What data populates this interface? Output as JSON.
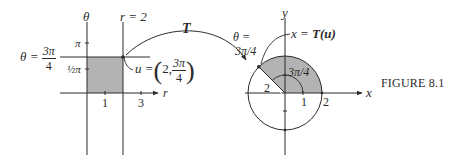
{
  "figure": {
    "caption": "FIGURE 8.1",
    "colors": {
      "line": "#2b2b2b",
      "shade": "#b3b3b3",
      "background": "#ffffff"
    }
  },
  "left_plot": {
    "vertical_axis_label": "θ",
    "horizontal_axis_label": "r",
    "line_r_label": "r = 2",
    "line_theta_label_lhs": "θ =",
    "line_theta_label_num": "3π",
    "line_theta_label_den": "4",
    "tick_pi": "π",
    "tick_half_pi": "½π",
    "tick_r_1": "1",
    "tick_r_3": "3",
    "point_label_lhs": "u =",
    "point_coord_r": "2,",
    "point_coord_num": "3π",
    "point_coord_den": "4"
  },
  "mapping": {
    "arrow_label": "T"
  },
  "right_plot": {
    "y_axis_label": "y",
    "x_axis_label": "x",
    "ray_label_top": "θ =",
    "ray_label_bottom": "3π/4",
    "image_label_var": "x =",
    "image_label_fn": "T(u)",
    "angle_label": "3π/4",
    "radius_label": "2",
    "tick_x_1": "1",
    "tick_x_2": "2"
  }
}
